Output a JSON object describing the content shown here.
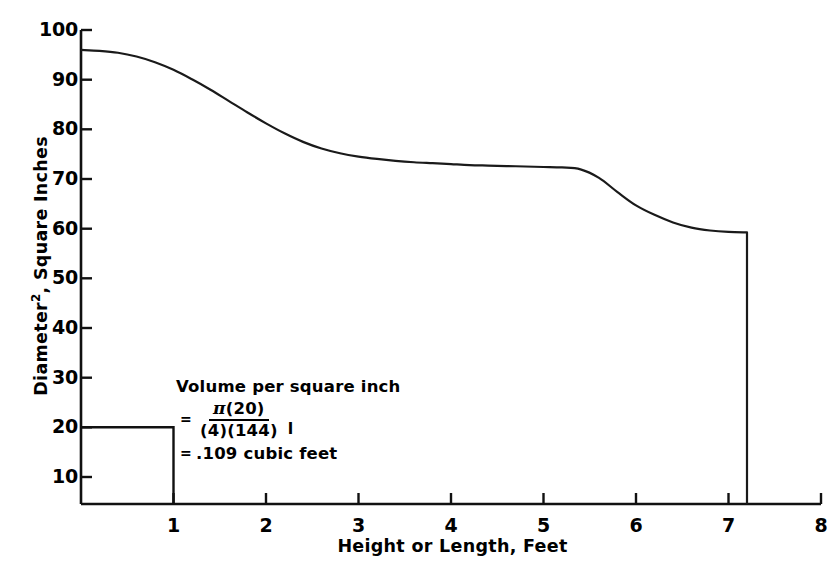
{
  "chart_data": {
    "type": "line",
    "title": "",
    "xlabel": "Height or Length, Feet",
    "ylabel": "Diameter2, Square Inches",
    "ylabel_base": "Diameter",
    "ylabel_sup": "2",
    "ylabel_rest": ", Square Inches",
    "xlim": [
      0,
      8
    ],
    "ylim": [
      0,
      100
    ],
    "grid": false,
    "legend": null,
    "xticks": [
      "1",
      "2",
      "3",
      "4",
      "5",
      "6",
      "7",
      "8"
    ],
    "xtick_values": [
      1,
      2,
      3,
      4,
      5,
      6,
      7,
      8
    ],
    "yticks": [
      "10",
      "20",
      "30",
      "40",
      "50",
      "60",
      "70",
      "80",
      "90",
      "100"
    ],
    "ytick_values": [
      10,
      20,
      30,
      40,
      50,
      60,
      70,
      80,
      90,
      100
    ],
    "series": [
      {
        "name": "Diameter squared vs height",
        "x": [
          0.0,
          0.2,
          0.4,
          0.6,
          0.8,
          1.0,
          1.2,
          1.4,
          1.6,
          1.8,
          2.0,
          2.2,
          2.4,
          2.6,
          2.8,
          3.0,
          3.2,
          3.4,
          3.6,
          3.8,
          4.0,
          4.2,
          4.4,
          4.6,
          4.8,
          5.0,
          5.2,
          5.4,
          5.6,
          5.8,
          6.0,
          6.2,
          6.4,
          6.6,
          6.8,
          7.0,
          7.2,
          7.2
        ],
        "y": [
          95.8,
          95.6,
          95.2,
          94.4,
          93.2,
          91.6,
          89.6,
          87.4,
          85.0,
          82.6,
          80.3,
          78.2,
          76.4,
          75.0,
          74.0,
          73.3,
          72.8,
          72.4,
          72.1,
          71.9,
          71.7,
          71.5,
          71.4,
          71.3,
          71.2,
          71.1,
          71.0,
          70.6,
          68.8,
          65.8,
          63.0,
          61.0,
          59.4,
          58.3,
          57.7,
          57.4,
          57.3,
          0.0
        ]
      }
    ],
    "reference_rectangle": {
      "x_start": 0,
      "x_end": 1,
      "height": 20,
      "description": "unit volume reference box, 1 foot wide by 20 square inches"
    }
  },
  "annotation": {
    "title": "Volume per square inch",
    "equals_1": "=",
    "numerator": "(20)",
    "pi_symbol": "π",
    "denominator": "(4)(144)",
    "trailing_symbol": "l",
    "equals_2": "=",
    "result": ".109 cubic feet"
  },
  "colors": {
    "line": "#1a1a1a",
    "axis": "#111111",
    "background": "#ffffff",
    "text": "#000000"
  }
}
